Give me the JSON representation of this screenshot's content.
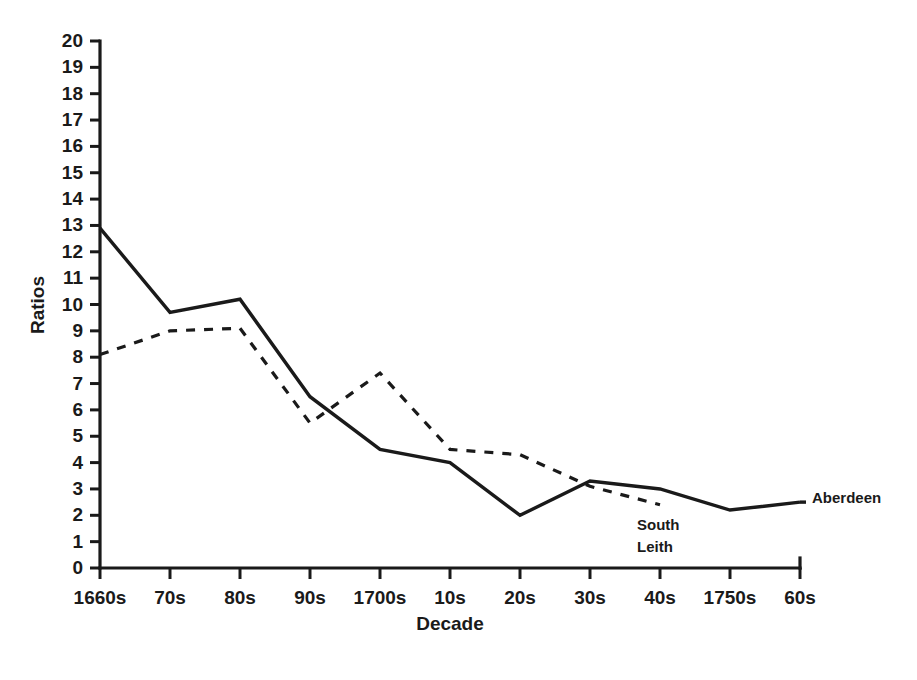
{
  "chart_data": {
    "type": "line",
    "title": "",
    "xlabel": "Decade",
    "ylabel": "Ratios",
    "categories": [
      "1660s",
      "70s",
      "80s",
      "90s",
      "1700s",
      "10s",
      "20s",
      "30s",
      "40s",
      "1750s",
      "60s"
    ],
    "ylim": [
      0,
      20
    ],
    "ytick_labels": [
      "0",
      "1",
      "2",
      "3",
      "4",
      "5",
      "6",
      "7",
      "8",
      "9",
      "10",
      "11",
      "12",
      "13",
      "14",
      "15",
      "16",
      "17",
      "18",
      "19",
      "20"
    ],
    "grid": false,
    "legend_position": "inline-right",
    "series": [
      {
        "name": "Aberdeen",
        "style": "solid",
        "color": "#1a1a1a",
        "values": [
          12.9,
          9.7,
          10.2,
          6.5,
          4.5,
          4.0,
          2.0,
          3.3,
          3.0,
          2.2,
          2.5
        ]
      },
      {
        "name": "South Leith",
        "style": "dashed",
        "color": "#1a1a1a",
        "values": [
          8.1,
          9.0,
          9.1,
          5.5,
          7.4,
          4.5,
          4.3,
          3.1,
          2.4,
          null,
          null
        ]
      }
    ],
    "annotations": [
      {
        "text": "Aberdeen",
        "x_category": "60s",
        "note": "inline series label at right end of solid line"
      },
      {
        "text": "South Leith",
        "x_category": "30s",
        "note": "inline series label below dashed line, wrapped on two lines"
      }
    ]
  },
  "labels": {
    "aberdeen": "Aberdeen",
    "south_leith_line1": "South",
    "south_leith_line2": "Leith"
  },
  "axes": {
    "y_title": "Ratios",
    "x_title": "Decade"
  }
}
